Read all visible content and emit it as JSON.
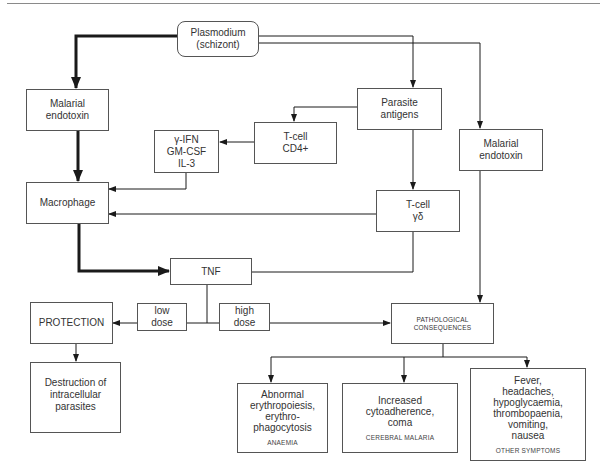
{
  "diagram": {
    "nodes": {
      "plasmodium": {
        "label": "Plasmodium\n(schizont)"
      },
      "endotoxin_left": {
        "label": "Malarial\nendotoxin"
      },
      "parasite_antigens": {
        "label": "Parasite\nantigens"
      },
      "tcell_cd4": {
        "label": "T-cell\nCD4+"
      },
      "cytokines": {
        "label": "γ-IFN\nGM-CSF\nIL-3"
      },
      "endotoxin_right": {
        "label": "Malarial\nendotoxin"
      },
      "macrophage": {
        "label": "Macrophage"
      },
      "tcell_gd": {
        "label": "T-cell\nγδ"
      },
      "tnf": {
        "label": "TNF"
      },
      "low_dose": {
        "label": "low\ndose"
      },
      "high_dose": {
        "label": "high\ndose"
      },
      "protection": {
        "label": "PROTECTION"
      },
      "destruction": {
        "label": "Destruction of\nintracellular\nparasites"
      },
      "pathological": {
        "label": "PATHOLOGICAL\nCONSEQUENCES"
      },
      "anaemia": {
        "label": "Abnormal\nerythropoiesis,\nerythro-\nphagocytosis",
        "caption": "ANAEMIA"
      },
      "cerebral": {
        "label": "Increased\ncytoadherence,\ncoma",
        "caption": "CEREBRAL MALARIA"
      },
      "other": {
        "label": "Fever,\nheadaches,\nhypoglycaemia,\nthrombopaenia,\nvomiting,\nnausea",
        "caption": "OTHER SYMPTOMS"
      }
    },
    "edges": [
      {
        "from": "plasmodium",
        "to": "endotoxin_left",
        "weight": "thick"
      },
      {
        "from": "plasmodium",
        "to": "parasite_antigens",
        "weight": "thin"
      },
      {
        "from": "plasmodium",
        "to": "endotoxin_right",
        "weight": "thin"
      },
      {
        "from": "parasite_antigens",
        "to": "tcell_cd4",
        "weight": "thin"
      },
      {
        "from": "parasite_antigens",
        "to": "tcell_gd",
        "weight": "thin"
      },
      {
        "from": "tcell_cd4",
        "to": "cytokines",
        "weight": "thin"
      },
      {
        "from": "cytokines",
        "to": "macrophage",
        "weight": "thin"
      },
      {
        "from": "endotoxin_left",
        "to": "macrophage",
        "weight": "thick"
      },
      {
        "from": "tcell_gd",
        "to": "macrophage",
        "weight": "thin"
      },
      {
        "from": "macrophage",
        "to": "tnf",
        "weight": "thick"
      },
      {
        "from": "tcell_gd",
        "to": "tnf",
        "weight": "thin"
      },
      {
        "from": "tnf",
        "to": "protection",
        "via": "low_dose",
        "weight": "thin"
      },
      {
        "from": "tnf",
        "to": "pathological",
        "via": "high_dose",
        "weight": "thin"
      },
      {
        "from": "endotoxin_right",
        "to": "pathological",
        "weight": "thin"
      },
      {
        "from": "protection",
        "to": "destruction",
        "weight": "thin"
      },
      {
        "from": "pathological",
        "to": "anaemia",
        "weight": "thin"
      },
      {
        "from": "pathological",
        "to": "cerebral",
        "weight": "thin"
      },
      {
        "from": "pathological",
        "to": "other",
        "weight": "thin"
      }
    ],
    "colors": {
      "line": "#1a1a1a",
      "border": "#555555",
      "background": "#ffffff"
    }
  }
}
